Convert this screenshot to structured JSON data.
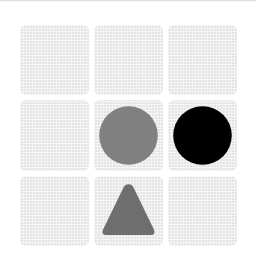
{
  "canvas": {
    "width": 256,
    "height": 268,
    "background_color": "#ffffff"
  },
  "top_rule": {
    "visible": true,
    "color": "#a8aaaf"
  },
  "board": {
    "name": "shape-grid",
    "rows": 3,
    "columns": 3,
    "cell_background_color": "#e5e5e5",
    "cell_corner_radius_px": 6,
    "cell_gap_px": 5,
    "left_px": 20,
    "top_px": 25,
    "width_px": 217,
    "height_px": 221,
    "cells": [
      {
        "index": 0,
        "row": 1,
        "column": 1,
        "shape": "none",
        "shape_label": "",
        "color": ""
      },
      {
        "index": 1,
        "row": 1,
        "column": 2,
        "shape": "none",
        "shape_label": "",
        "color": ""
      },
      {
        "index": 2,
        "row": 1,
        "column": 3,
        "shape": "none",
        "shape_label": "",
        "color": ""
      },
      {
        "index": 3,
        "row": 2,
        "column": 1,
        "shape": "none",
        "shape_label": "",
        "color": ""
      },
      {
        "index": 4,
        "row": 2,
        "column": 2,
        "shape": "circle",
        "shape_label": "gray circle",
        "color": "#808080"
      },
      {
        "index": 5,
        "row": 2,
        "column": 3,
        "shape": "circle",
        "shape_label": "black circle",
        "color": "#000000"
      },
      {
        "index": 6,
        "row": 3,
        "column": 1,
        "shape": "none",
        "shape_label": "",
        "color": ""
      },
      {
        "index": 7,
        "row": 3,
        "column": 2,
        "shape": "triangle",
        "shape_label": "gray triangle",
        "color": "#6e6e6e"
      },
      {
        "index": 8,
        "row": 3,
        "column": 3,
        "shape": "none",
        "shape_label": "",
        "color": ""
      }
    ]
  }
}
